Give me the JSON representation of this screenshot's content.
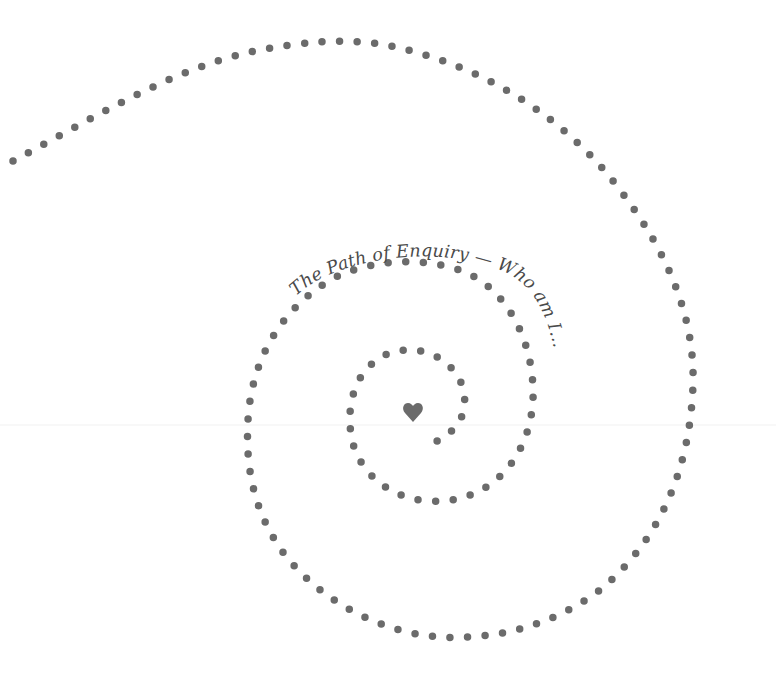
{
  "artwork": {
    "title": "The Path of Enquiry — Who am I...",
    "center_symbol": "heart-icon",
    "colors": {
      "dots": "#6b6b6b",
      "text": "#4a4a4a",
      "background": "#ffffff"
    }
  }
}
